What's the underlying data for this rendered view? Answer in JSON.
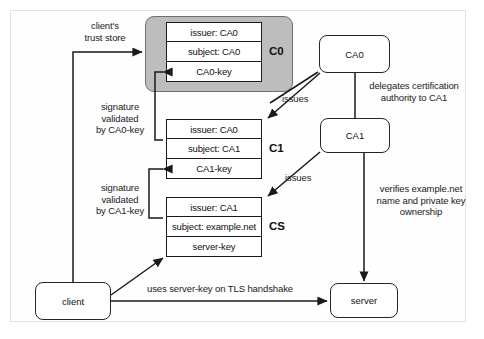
{
  "diagram": {
    "frame_color": "#e2e2e2",
    "group_fill": "#bdbdbd",
    "line_color": "#1a1a1a"
  },
  "certificates": [
    {
      "tag": "C0",
      "rows": [
        "issuer: CA0",
        "subject: CA0",
        "CA0-key"
      ]
    },
    {
      "tag": "C1",
      "rows": [
        "issuer: CA0",
        "subject: CA1",
        "CA1-key"
      ]
    },
    {
      "tag": "CS",
      "rows": [
        "issuer: CA1",
        "subject: example.net",
        "server-key"
      ]
    }
  ],
  "nodes": {
    "ca0": "CA0",
    "ca1": "CA1",
    "client": "client",
    "server": "server"
  },
  "labels": {
    "trust_store": "client's\ntrust store",
    "sig_ca0": "signature\nvalidated\nby CA0-key",
    "sig_ca1": "signature\nvalidated\nby CA1-key",
    "issues_c0": "issues",
    "issues_c1": "issues",
    "delegates": "delegates certification\nauthority to CA1",
    "verifies": "verifies example.net\nname and private key\nownership",
    "handshake": "uses server-key on TLS handshake"
  }
}
